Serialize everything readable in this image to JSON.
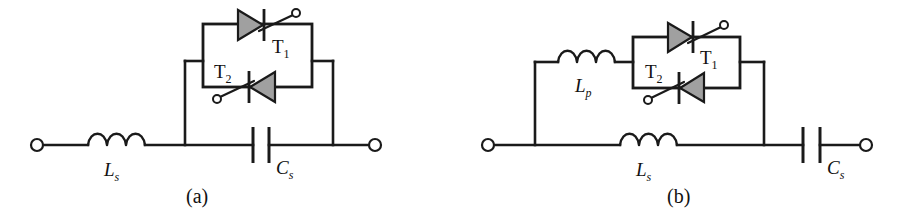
{
  "figure": {
    "type": "electrical-schematic",
    "background_color": "#ffffff",
    "line_color": "#1a1a1a",
    "thyristor_fill_color": "#a0a0a0"
  },
  "circuits": [
    {
      "id": "a",
      "caption": "(a)",
      "components": [
        {
          "name": "series-inductor",
          "label": "L",
          "subscript": "s",
          "type": "inductor"
        },
        {
          "name": "series-capacitor",
          "label": "C",
          "subscript": "s",
          "type": "capacitor"
        },
        {
          "name": "thyristor-upper",
          "label": "T",
          "subscript": "1",
          "type": "thyristor",
          "direction": "right"
        },
        {
          "name": "thyristor-lower",
          "label": "T",
          "subscript": "2",
          "type": "thyristor",
          "direction": "left"
        }
      ],
      "terminals": [
        "left-terminal",
        "right-terminal"
      ]
    },
    {
      "id": "b",
      "caption": "(b)",
      "components": [
        {
          "name": "parallel-inductor",
          "label": "L",
          "subscript": "p",
          "type": "inductor"
        },
        {
          "name": "series-inductor",
          "label": "L",
          "subscript": "s",
          "type": "inductor"
        },
        {
          "name": "series-capacitor",
          "label": "C",
          "subscript": "s",
          "type": "capacitor"
        },
        {
          "name": "thyristor-upper",
          "label": "T",
          "subscript": "1",
          "type": "thyristor",
          "direction": "right"
        },
        {
          "name": "thyristor-lower",
          "label": "T",
          "subscript": "2",
          "type": "thyristor",
          "direction": "left"
        }
      ],
      "terminals": [
        "left-terminal",
        "right-terminal"
      ]
    }
  ],
  "labels": {
    "a_Ls_main": "L",
    "a_Ls_sub": "s",
    "a_Cs_main": "C",
    "a_Cs_sub": "s",
    "a_T1_main": "T",
    "a_T1_sub": "1",
    "a_T2_main": "T",
    "a_T2_sub": "2",
    "a_caption": "(a)",
    "b_Lp_main": "L",
    "b_Lp_sub": "p",
    "b_Ls_main": "L",
    "b_Ls_sub": "s",
    "b_Cs_main": "C",
    "b_Cs_sub": "s",
    "b_T1_main": "T",
    "b_T1_sub": "1",
    "b_T2_main": "T",
    "b_T2_sub": "2",
    "b_caption": "(b)"
  }
}
